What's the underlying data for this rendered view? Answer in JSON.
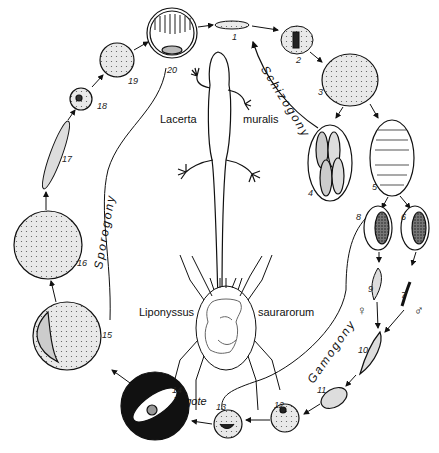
{
  "diagram": {
    "type": "life-cycle",
    "hosts": {
      "vertebrate": {
        "genus": "Lacerta",
        "species": "muralis"
      },
      "invertebrate": {
        "genus": "Liponyssus",
        "species": "saurarorum"
      }
    },
    "phases": {
      "schizogony": "Schizogony",
      "gamogony": "Gamogony",
      "sporogony": "Sporogony"
    },
    "zygote_label": "Zygote",
    "sex_symbols": {
      "female": "♀",
      "male": "♂"
    },
    "stages": [
      {
        "n": "1"
      },
      {
        "n": "2"
      },
      {
        "n": "3"
      },
      {
        "n": "4"
      },
      {
        "n": "5"
      },
      {
        "n": "6"
      },
      {
        "n": "7"
      },
      {
        "n": "8"
      },
      {
        "n": "9"
      },
      {
        "n": "10"
      },
      {
        "n": "11"
      },
      {
        "n": "12"
      },
      {
        "n": "13"
      },
      {
        "n": "14"
      },
      {
        "n": "15"
      },
      {
        "n": "16"
      },
      {
        "n": "17"
      },
      {
        "n": "18"
      },
      {
        "n": "19"
      },
      {
        "n": "20"
      }
    ]
  }
}
